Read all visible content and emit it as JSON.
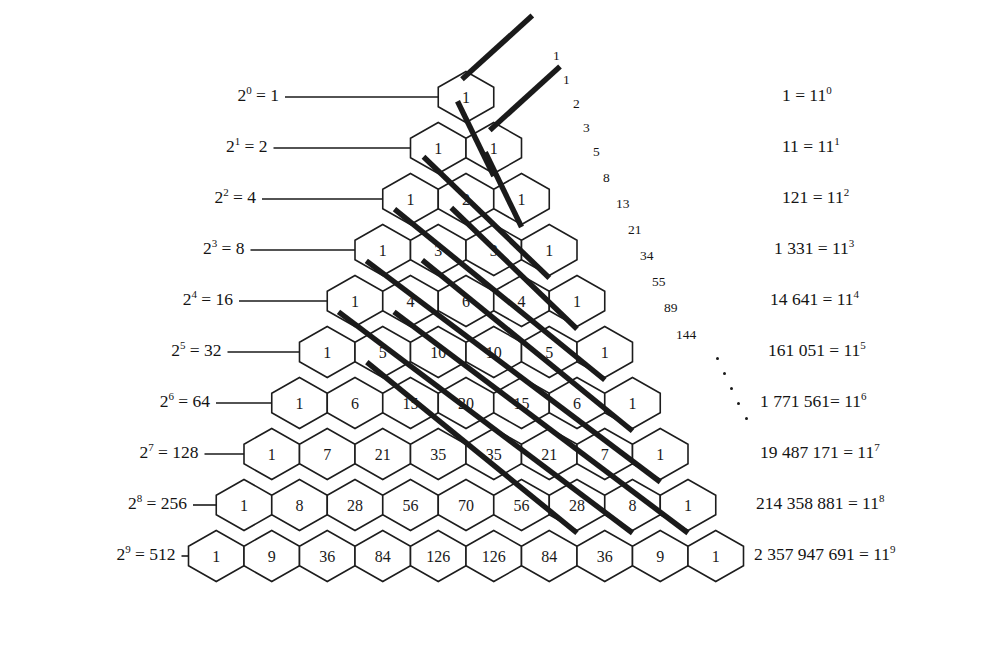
{
  "figure": {
    "ink_color": "#1a1a1a",
    "background": "#ffffff"
  },
  "chart_data": {
    "type": "table",
    "xlabel": "",
    "ylabel": "",
    "rows": [
      [
        1
      ],
      [
        1,
        1
      ],
      [
        1,
        2,
        1
      ],
      [
        1,
        3,
        3,
        1
      ],
      [
        1,
        4,
        6,
        4,
        1
      ],
      [
        1,
        5,
        10,
        10,
        5,
        1
      ],
      [
        1,
        6,
        15,
        20,
        15,
        6,
        1
      ],
      [
        1,
        7,
        21,
        35,
        35,
        21,
        7,
        1
      ],
      [
        1,
        8,
        28,
        56,
        70,
        56,
        28,
        8,
        1
      ],
      [
        1,
        9,
        36,
        84,
        126,
        126,
        84,
        36,
        9,
        1
      ]
    ],
    "row_sums_powers_of_two": [
      1,
      2,
      4,
      8,
      16,
      32,
      64,
      128,
      256,
      512
    ],
    "diagonal_fibonacci": [
      1,
      1,
      2,
      3,
      5,
      8,
      13,
      21,
      34,
      55,
      89,
      144
    ],
    "powers_of_eleven": [
      1,
      11,
      121,
      1331,
      14641,
      161051,
      1771561,
      19487171,
      214358881,
      2357947691
    ]
  },
  "left_labels": [
    {
      "base": "2",
      "exp": "0",
      "eq": " = 1"
    },
    {
      "base": "2",
      "exp": "1",
      "eq": " = 2"
    },
    {
      "base": "2",
      "exp": "2",
      "eq": " = 4"
    },
    {
      "base": "2",
      "exp": "3",
      "eq": " = 8"
    },
    {
      "base": "2",
      "exp": "4",
      "eq": " = 16"
    },
    {
      "base": "2",
      "exp": "5",
      "eq": " = 32"
    },
    {
      "base": "2",
      "exp": "6",
      "eq": " = 64"
    },
    {
      "base": "2",
      "exp": "7",
      "eq": " = 128"
    },
    {
      "base": "2",
      "exp": "8",
      "eq": " = 256"
    },
    {
      "base": "2",
      "exp": "9",
      "eq": " = 512"
    }
  ],
  "fib_labels": [
    {
      "value": "1"
    },
    {
      "value": "1"
    },
    {
      "value": "2"
    },
    {
      "value": "3"
    },
    {
      "value": "5"
    },
    {
      "value": "8"
    },
    {
      "value": "13"
    },
    {
      "value": "21"
    },
    {
      "value": "34"
    },
    {
      "value": "55"
    },
    {
      "value": "89"
    },
    {
      "value": "144"
    }
  ],
  "right_labels": [
    {
      "lhs": "1 = 11",
      "exp": "0"
    },
    {
      "lhs": "11 = 11",
      "exp": "1"
    },
    {
      "lhs": "121 = 11",
      "exp": "2"
    },
    {
      "lhs": "1 331 = 11",
      "exp": "3"
    },
    {
      "lhs": "14 641 = 11",
      "exp": "4"
    },
    {
      "lhs": "161 051 = 11",
      "exp": "5"
    },
    {
      "lhs": "1 771 561= 11",
      "exp": "6"
    },
    {
      "lhs": "19 487 171 = 11",
      "exp": "7"
    },
    {
      "lhs": "214 358 881 = 11",
      "exp": "8"
    },
    {
      "lhs": "2 357 947 691 = 11",
      "exp": "9"
    }
  ],
  "ellipsis": {
    "label": "diagonal-dots",
    "count": 5
  }
}
